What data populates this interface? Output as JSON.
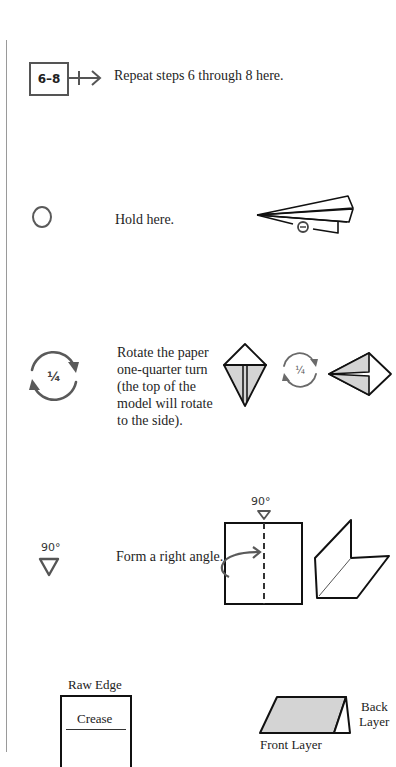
{
  "symbols": [
    {
      "id": "repeat",
      "icon": "repeat-steps-box-icon",
      "icon_label": "6–8",
      "description": "Repeat steps 6 through 8 here."
    },
    {
      "id": "hold",
      "icon": "hold-circle-icon",
      "description": "Hold here."
    },
    {
      "id": "rotate",
      "icon": "rotate-quarter-icon",
      "icon_label": "1/4",
      "icon_label_glyph": "¼",
      "description_lines": [
        "Rotate the paper",
        "one-quarter turn",
        "(the top of the",
        "model will rotate",
        "to the side)."
      ],
      "example_rotate_label": "¼"
    },
    {
      "id": "right-angle",
      "icon": "right-angle-triangle-icon",
      "icon_label": "90°",
      "description": "Form a right angle.",
      "example_label": "90°"
    }
  ],
  "legend": {
    "raw_edge_label": "Raw Edge",
    "crease_label": "Crease",
    "back_layer_lines": [
      "Back",
      "Layer"
    ],
    "front_layer_label": "Front Layer"
  },
  "colors": {
    "ink": "#1c1c1c",
    "icon_gray": "#5a5a5a",
    "fill_gray": "#d4d4d4",
    "rule": "#9a9a9a"
  }
}
